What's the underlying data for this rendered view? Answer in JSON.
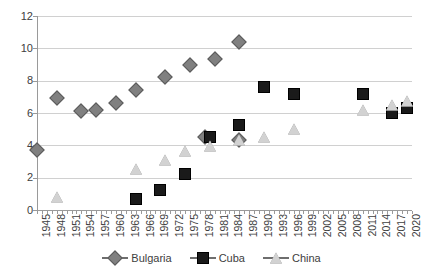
{
  "chart_data": {
    "type": "scatter",
    "title": "",
    "xlabel": "",
    "ylabel": "",
    "xlim": [
      1945,
      2021
    ],
    "ylim": [
      0,
      12
    ],
    "y_ticks": [
      0,
      2,
      4,
      6,
      8,
      10,
      12
    ],
    "x_ticks": [
      1945,
      1948,
      1951,
      1954,
      1957,
      1960,
      1963,
      1966,
      1969,
      1972,
      1975,
      1978,
      1981,
      1984,
      1987,
      1990,
      1993,
      1996,
      1999,
      2002,
      2005,
      2008,
      2011,
      2014,
      2017,
      2020
    ],
    "grid": true,
    "legend_position": "bottom",
    "series": [
      {
        "name": "Bulgaria",
        "marker": "diamond",
        "color": "#808080",
        "points": [
          {
            "x": 1945,
            "y": 3.7
          },
          {
            "x": 1949,
            "y": 6.9
          },
          {
            "x": 1954,
            "y": 6.1
          },
          {
            "x": 1957,
            "y": 6.2
          },
          {
            "x": 1961,
            "y": 6.6
          },
          {
            "x": 1965,
            "y": 7.4
          },
          {
            "x": 1971,
            "y": 8.25
          },
          {
            "x": 1976,
            "y": 9.0
          },
          {
            "x": 1981,
            "y": 9.35
          },
          {
            "x": 1986,
            "y": 10.4
          },
          {
            "x": 1979,
            "y": 4.5
          },
          {
            "x": 1986,
            "y": 4.3
          }
        ]
      },
      {
        "name": "Cuba",
        "marker": "square",
        "color": "#1a1a1a",
        "points": [
          {
            "x": 1965,
            "y": 0.65
          },
          {
            "x": 1970,
            "y": 1.25
          },
          {
            "x": 1975,
            "y": 2.25
          },
          {
            "x": 1980,
            "y": 4.5
          },
          {
            "x": 1986,
            "y": 5.25
          },
          {
            "x": 1991,
            "y": 7.6
          },
          {
            "x": 1997,
            "y": 7.15
          },
          {
            "x": 2011,
            "y": 7.2
          },
          {
            "x": 2017,
            "y": 6.0
          },
          {
            "x": 2020,
            "y": 6.3
          }
        ]
      },
      {
        "name": "China",
        "marker": "triangle",
        "color": "#d2d2d2",
        "points": [
          {
            "x": 1949,
            "y": 0.8
          },
          {
            "x": 1965,
            "y": 2.55
          },
          {
            "x": 1971,
            "y": 3.1
          },
          {
            "x": 1975,
            "y": 3.65
          },
          {
            "x": 1980,
            "y": 3.95
          },
          {
            "x": 1986,
            "y": 4.3
          },
          {
            "x": 1991,
            "y": 4.5
          },
          {
            "x": 1997,
            "y": 5.0
          },
          {
            "x": 2011,
            "y": 6.2
          },
          {
            "x": 2017,
            "y": 6.5
          },
          {
            "x": 2020,
            "y": 6.75
          }
        ]
      }
    ]
  },
  "legend": {
    "items": [
      {
        "label": "Bulgaria",
        "marker": "diamond-icon"
      },
      {
        "label": "Cuba",
        "marker": "square-icon"
      },
      {
        "label": "China",
        "marker": "triangle-icon"
      }
    ]
  }
}
